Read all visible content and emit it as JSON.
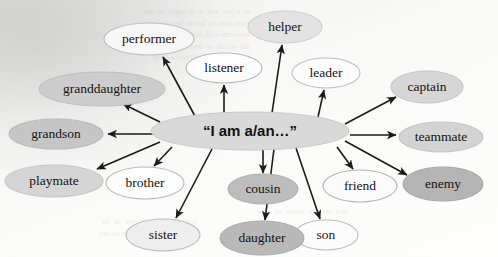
{
  "diagram": {
    "type": "radial-concept-map",
    "center": {
      "label": "“I am a/an…”",
      "cx": 250,
      "cy": 131,
      "rx": 99,
      "ry": 19,
      "fill": "#d9d9d9",
      "stroke": "#c9c9c9",
      "font_size": 15
    },
    "edge_color": "#1b1b1b",
    "nodes": [
      {
        "id": "performer",
        "label": "performer",
        "cx": 149,
        "cy": 39,
        "rx": 45,
        "ry": 16,
        "fill": "#f7f7f7",
        "stroke": "#bdbdbd",
        "font_size": 13.5
      },
      {
        "id": "listener",
        "label": "listener",
        "cx": 224,
        "cy": 68,
        "rx": 38,
        "ry": 15,
        "fill": "#fdfdfd",
        "stroke": "#b8b8b8",
        "font_size": 13.5
      },
      {
        "id": "helper",
        "label": "helper",
        "cx": 285,
        "cy": 27,
        "rx": 37,
        "ry": 16,
        "fill": "#e3e3e3",
        "stroke": "#cfcfcf",
        "font_size": 13.5
      },
      {
        "id": "leader",
        "label": "leader",
        "cx": 326,
        "cy": 73,
        "rx": 34,
        "ry": 15,
        "fill": "#fdfdfd",
        "stroke": "#c0c0c0",
        "font_size": 13.5
      },
      {
        "id": "captain",
        "label": "captain",
        "cx": 427,
        "cy": 87,
        "rx": 36,
        "ry": 16,
        "fill": "#d6d6d6",
        "stroke": "#c6c6c6",
        "font_size": 13.5
      },
      {
        "id": "teammate",
        "label": "teammate",
        "cx": 441,
        "cy": 137,
        "rx": 42,
        "ry": 15,
        "fill": "#d3d3d3",
        "stroke": "#c4c4c4",
        "font_size": 13.5
      },
      {
        "id": "enemy",
        "label": "enemy",
        "cx": 443,
        "cy": 184,
        "rx": 40,
        "ry": 17,
        "fill": "#b4b4b4",
        "stroke": "#a8a8a8",
        "font_size": 13.5
      },
      {
        "id": "friend",
        "label": "friend",
        "cx": 360,
        "cy": 186,
        "rx": 37,
        "ry": 16,
        "fill": "#fbfbfb",
        "stroke": "#b4b4b4",
        "font_size": 13.5
      },
      {
        "id": "son",
        "label": "son",
        "cx": 326,
        "cy": 235,
        "rx": 32,
        "ry": 15,
        "fill": "#fcfcfc",
        "stroke": "#bdbdbd",
        "font_size": 13.5
      },
      {
        "id": "daughter",
        "label": "daughter",
        "cx": 262,
        "cy": 238,
        "rx": 42,
        "ry": 17,
        "fill": "#b9b9b9",
        "stroke": "#ababab",
        "font_size": 13.5
      },
      {
        "id": "cousin",
        "label": "cousin",
        "cx": 263,
        "cy": 189,
        "rx": 35,
        "ry": 15,
        "fill": "#bdbdbd",
        "stroke": "#b0b0b0",
        "font_size": 13.5
      },
      {
        "id": "sister",
        "label": "sister",
        "cx": 163,
        "cy": 235,
        "rx": 37,
        "ry": 16,
        "fill": "#eeeeee",
        "stroke": "#bcbcbc",
        "font_size": 13.5
      },
      {
        "id": "brother",
        "label": "brother",
        "cx": 145,
        "cy": 183,
        "rx": 39,
        "ry": 16,
        "fill": "#fdfdfd",
        "stroke": "#bababa",
        "font_size": 13.5
      },
      {
        "id": "playmate",
        "label": "playmate",
        "cx": 54,
        "cy": 181,
        "rx": 49,
        "ry": 16,
        "fill": "#d5d5d5",
        "stroke": "#c6c6c6",
        "font_size": 13.5
      },
      {
        "id": "grandson",
        "label": "grandson",
        "cx": 56,
        "cy": 134,
        "rx": 47,
        "ry": 15,
        "fill": "#c6c6c6",
        "stroke": "#b9b9b9",
        "font_size": 13.5
      },
      {
        "id": "granddaughter",
        "label": "granddaughter",
        "cx": 102,
        "cy": 89,
        "rx": 63,
        "ry": 17,
        "fill": "#cdcdcd",
        "stroke": "#bfbfbf",
        "font_size": 13.5
      }
    ],
    "edges": [
      {
        "from": "center",
        "to": "performer",
        "x1": 196,
        "y1": 118,
        "x2": 163,
        "y2": 57
      },
      {
        "from": "center",
        "to": "listener",
        "x1": 224,
        "y1": 113,
        "x2": 224,
        "y2": 85
      },
      {
        "from": "center",
        "to": "helper",
        "x1": 272,
        "y1": 113,
        "x2": 282,
        "y2": 45
      },
      {
        "from": "center",
        "to": "leader",
        "x1": 318,
        "y1": 117,
        "x2": 324,
        "y2": 90
      },
      {
        "from": "center",
        "to": "captain",
        "x1": 345,
        "y1": 124,
        "x2": 396,
        "y2": 97
      },
      {
        "from": "center",
        "to": "teammate",
        "x1": 350,
        "y1": 135,
        "x2": 396,
        "y2": 135
      },
      {
        "from": "center",
        "to": "enemy",
        "x1": 345,
        "y1": 141,
        "x2": 407,
        "y2": 175
      },
      {
        "from": "center",
        "to": "friend",
        "x1": 337,
        "y1": 147,
        "x2": 353,
        "y2": 169
      },
      {
        "from": "center",
        "to": "son",
        "x1": 296,
        "y1": 148,
        "x2": 320,
        "y2": 219
      },
      {
        "from": "center",
        "to": "daughter",
        "x1": 274,
        "y1": 149,
        "x2": 265,
        "y2": 220
      },
      {
        "from": "center",
        "to": "cousin",
        "x1": 263,
        "y1": 150,
        "x2": 263,
        "y2": 173
      },
      {
        "from": "center",
        "to": "sister",
        "x1": 212,
        "y1": 149,
        "x2": 176,
        "y2": 218
      },
      {
        "from": "center",
        "to": "brother",
        "x1": 172,
        "y1": 147,
        "x2": 154,
        "y2": 166
      },
      {
        "from": "center",
        "to": "playmate",
        "x1": 160,
        "y1": 142,
        "x2": 97,
        "y2": 169
      },
      {
        "from": "center",
        "to": "grandson",
        "x1": 153,
        "y1": 134,
        "x2": 108,
        "y2": 134
      },
      {
        "from": "center",
        "to": "granddaughter",
        "x1": 160,
        "y1": 122,
        "x2": 123,
        "y2": 104
      }
    ]
  },
  "background_bleed": {
    "description": "faint mirrored show-through text from the reverse side of the scanned page",
    "blocks": [
      {
        "x": 248,
        "y": 6,
        "text": "of a few and  a  thought  to  the\nform into us but in her outline\nbetween with some that is one\nthe words on over a them was\nto make in which see a clear"
      },
      {
        "x": 300,
        "y": 216,
        "text": "is another  to  choose  or  to\nby another check in to so see"
      },
      {
        "x": 150,
        "y": 206,
        "text": "and  so  the  name  of  one"
      }
    ]
  }
}
